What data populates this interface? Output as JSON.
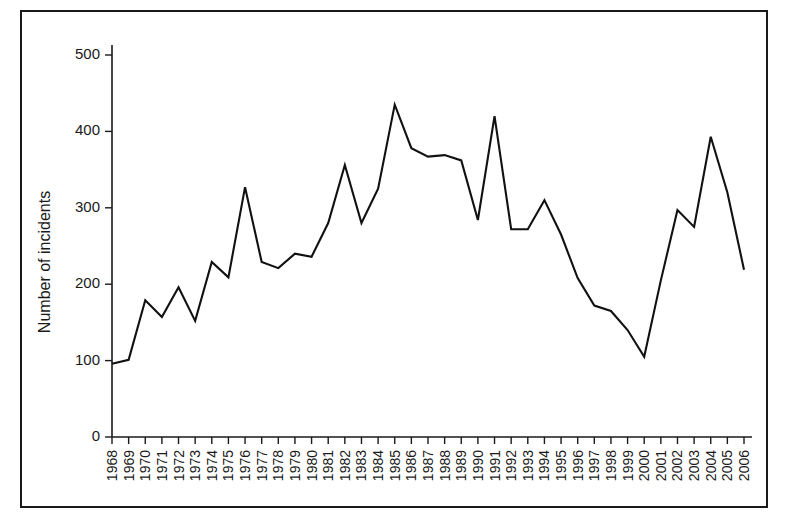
{
  "chart_data": {
    "type": "line",
    "title": "",
    "subtitle": "",
    "xlabel": "",
    "ylabel": "Number of incidents",
    "xlim": [
      1968,
      2006
    ],
    "ylim": [
      0,
      500
    ],
    "yticks": [
      0,
      100,
      200,
      300,
      400,
      500
    ],
    "grid": false,
    "legend": false,
    "legend_position": "none",
    "line_color": "#111111",
    "categories": [
      "1968",
      "1969",
      "1970",
      "1971",
      "1972",
      "1973",
      "1974",
      "1975",
      "1976",
      "1977",
      "1978",
      "1979",
      "1980",
      "1981",
      "1982",
      "1983",
      "1984",
      "1985",
      "1986",
      "1987",
      "1988",
      "1989",
      "1990",
      "1991",
      "1992",
      "1993",
      "1994",
      "1995",
      "1996",
      "1997",
      "1998",
      "1999",
      "2000",
      "2001",
      "2002",
      "2003",
      "2004",
      "2005",
      "2006"
    ],
    "x": [
      1968,
      1969,
      1970,
      1971,
      1972,
      1973,
      1974,
      1975,
      1976,
      1977,
      1978,
      1979,
      1980,
      1981,
      1982,
      1983,
      1984,
      1985,
      1986,
      1987,
      1988,
      1989,
      1990,
      1991,
      1992,
      1993,
      1994,
      1995,
      1996,
      1997,
      1998,
      1999,
      2000,
      2001,
      2002,
      2003,
      2004,
      2005,
      2006
    ],
    "values": [
      96,
      101,
      179,
      157,
      196,
      152,
      229,
      209,
      327,
      229,
      221,
      240,
      236,
      280,
      356,
      280,
      325,
      435,
      378,
      367,
      369,
      362,
      284,
      420,
      272,
      272,
      310,
      265,
      208,
      172,
      165,
      140,
      105,
      205,
      297,
      275,
      393,
      320,
      219
    ],
    "series": [
      {
        "name": "Number of incidents",
        "values": [
          96,
          101,
          179,
          157,
          196,
          152,
          229,
          209,
          327,
          229,
          221,
          240,
          236,
          280,
          356,
          280,
          325,
          435,
          378,
          367,
          369,
          362,
          284,
          420,
          272,
          272,
          310,
          265,
          208,
          172,
          165,
          140,
          105,
          205,
          297,
          275,
          393,
          320,
          219
        ]
      }
    ],
    "annotations": []
  },
  "figure": {
    "border_color": "#1a1a1a",
    "background": "#ffffff"
  }
}
